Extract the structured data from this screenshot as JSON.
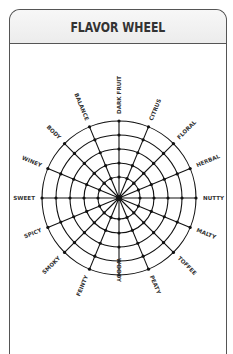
{
  "header": {
    "title": "FLAVOR WHEEL"
  },
  "wheel": {
    "center": [
      119,
      198
    ],
    "ring_radii": [
      21,
      35,
      49,
      63,
      77
    ],
    "label_radius": 84,
    "spoke_count": 16,
    "line_color": "#111111",
    "labels": [
      "DARK FRUIT",
      "CITRUS",
      "FLORAL",
      "HERBAL",
      "NUTTY",
      "MALTY",
      "TOFFEE",
      "PEATY",
      "WOODY",
      "FEINTY",
      "SMOKY",
      "SPICY",
      "SWEET",
      "WINEY",
      "BODY",
      "BALANCE"
    ]
  }
}
